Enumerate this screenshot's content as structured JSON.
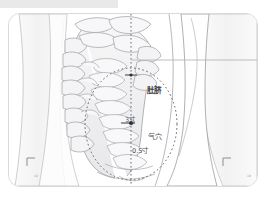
{
  "figure": {
    "kind": "anatomical-acupoint-diagram",
    "background_color": "#ffffff",
    "frame_color": "#d9d9dc",
    "topbar_color": "#e9e9ea",
    "ink_color": "#8d8d93",
    "label_color": "#3b3b3f"
  },
  "labels": {
    "navel": "肚脐",
    "distance_upper": "3寸",
    "point_qixue": "气穴",
    "distance_lower": "0.5寸"
  },
  "corner_marks": {
    "left": "18",
    "right": "19"
  },
  "guides": {
    "midline": "vertical dotted midline",
    "ellipse": "dotted ellipse region",
    "horizontal": "horizontal reference line"
  },
  "points": [
    {
      "name": "肚脐",
      "x": 130,
      "y": 74
    },
    {
      "name": "气穴",
      "x": 130,
      "y": 122
    }
  ]
}
